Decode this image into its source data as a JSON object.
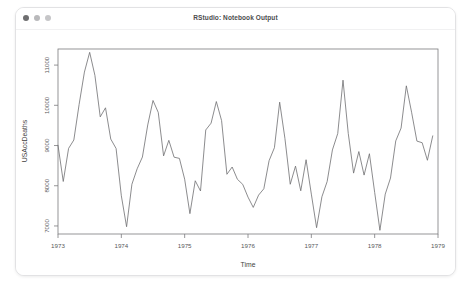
{
  "window": {
    "title": "RStudio: Notebook Output",
    "controls": [
      {
        "name": "close",
        "color": "#6e6e70"
      },
      {
        "name": "minimize",
        "color": "#b9b9bb"
      },
      {
        "name": "maximize",
        "color": "#c6c6c8"
      }
    ]
  },
  "chart_data": {
    "type": "line",
    "title": "",
    "xlabel": "Time",
    "ylabel": "USAccDeaths",
    "xlim": [
      1973.0,
      1979.0
    ],
    "ylim": [
      6800,
      11400
    ],
    "xticks": [
      1973,
      1974,
      1975,
      1976,
      1977,
      1978,
      1979
    ],
    "xticklabels": [
      "1973",
      "1974",
      "1975",
      "1976",
      "1977",
      "1978",
      "1979"
    ],
    "yticks": [
      7000,
      8000,
      9000,
      10000,
      11000
    ],
    "yticklabels": [
      "7000",
      "8000",
      "9000",
      "10000",
      "11000"
    ],
    "grid": false,
    "legend": false,
    "line_color": "#6f6f71",
    "series": [
      {
        "name": "USAccDeaths",
        "x": [
          1973.0,
          1973.083,
          1973.167,
          1973.25,
          1973.333,
          1973.417,
          1973.5,
          1973.583,
          1973.667,
          1973.75,
          1973.833,
          1973.917,
          1974.0,
          1974.083,
          1974.167,
          1974.25,
          1974.333,
          1974.417,
          1974.5,
          1974.583,
          1974.667,
          1974.75,
          1974.833,
          1974.917,
          1975.0,
          1975.083,
          1975.167,
          1975.25,
          1975.333,
          1975.417,
          1975.5,
          1975.583,
          1975.667,
          1975.75,
          1975.833,
          1975.917,
          1976.0,
          1976.083,
          1976.167,
          1976.25,
          1976.333,
          1976.417,
          1976.5,
          1976.583,
          1976.667,
          1976.75,
          1976.833,
          1976.917,
          1977.0,
          1977.083,
          1977.167,
          1977.25,
          1977.333,
          1977.417,
          1977.5,
          1977.583,
          1977.667,
          1977.75,
          1977.833,
          1977.917,
          1978.0,
          1978.083,
          1978.167,
          1978.25,
          1978.333,
          1978.417,
          1978.5,
          1978.583,
          1978.667,
          1978.75,
          1978.833,
          1978.917
        ],
        "values": [
          9007,
          8106,
          8928,
          9137,
          10017,
          10826,
          11317,
          10744,
          9713,
          9938,
          9161,
          8927,
          7750,
          6981,
          8038,
          8422,
          8714,
          9512,
          10120,
          9823,
          8743,
          9129,
          8710,
          8680,
          8162,
          7306,
          8124,
          7870,
          9387,
          9556,
          10093,
          9620,
          8285,
          8466,
          8160,
          8034,
          7717,
          7461,
          7767,
          7925,
          8623,
          8945,
          10078,
          9179,
          8037,
          8488,
          7874,
          8647,
          7792,
          6957,
          7726,
          8106,
          8890,
          9299,
          10625,
          9302,
          8314,
          8850,
          8265,
          8796,
          7836,
          6892,
          7791,
          8192,
          9115,
          9434,
          10484,
          9827,
          9110,
          9070,
          8633,
          9240
        ]
      }
    ]
  }
}
